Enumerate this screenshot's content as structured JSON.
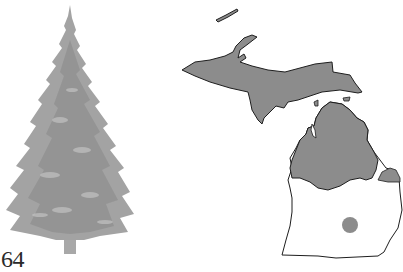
{
  "page": {
    "number": "64"
  },
  "illustration": {
    "subject": "spruce-tree-icon",
    "foliage_color": "#9a9a9a",
    "foliage_dark": "#7e7e7e",
    "foliage_light": "#bdbdbd",
    "trunk_color": "#a8a8a8"
  },
  "range_map": {
    "region": "Michigan",
    "fill_color": "#8c8c8c",
    "outline_color": "#1e1e1e",
    "land_color": "#ffffff",
    "shaded_areas": [
      "Upper Peninsula",
      "Isle Royale",
      "Northern Lower Peninsula",
      "Thumb area",
      "Isolated south-central population"
    ]
  }
}
